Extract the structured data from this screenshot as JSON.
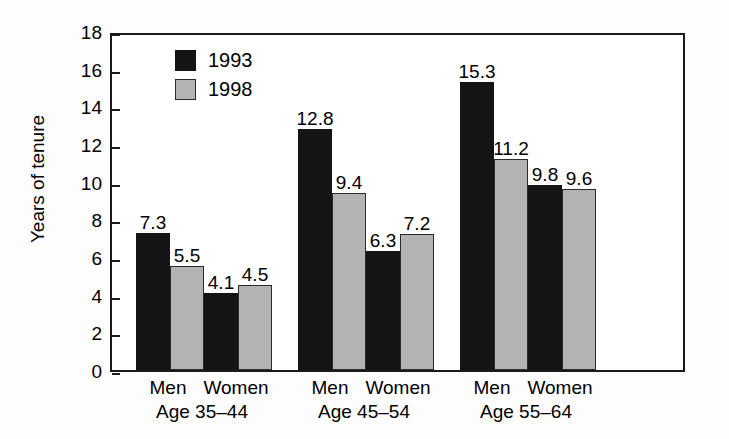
{
  "chart_data": {
    "type": "bar",
    "title": "",
    "xlabel": "",
    "ylabel": "Years of tenure",
    "ylim": [
      0,
      18
    ],
    "ytick_labels": [
      "18",
      "16",
      "14",
      "12",
      "10",
      "8",
      "6",
      "4",
      "2",
      "0"
    ],
    "yticks": [
      18,
      16,
      14,
      12,
      10,
      8,
      6,
      4,
      2,
      0
    ],
    "grid": false,
    "legend_position": "top-left-inside",
    "categories": [
      "Men",
      "Women",
      "Men",
      "Women",
      "Men",
      "Women"
    ],
    "groups": [
      {
        "label": "Age 35–44",
        "categories": [
          "Men",
          "Women"
        ]
      },
      {
        "label": "Age 45–54",
        "categories": [
          "Men",
          "Women"
        ]
      },
      {
        "label": "Age 55–64",
        "categories": [
          "Men",
          "Women"
        ]
      }
    ],
    "series": [
      {
        "name": "1993",
        "color": "#141414",
        "values": [
          7.3,
          4.1,
          12.8,
          6.3,
          15.3,
          9.8
        ]
      },
      {
        "name": "1998",
        "color": "#b3b3b3",
        "values": [
          5.5,
          4.5,
          9.4,
          7.2,
          11.2,
          9.6
        ]
      }
    ],
    "data_labels": [
      {
        "category": "Men",
        "group": "Age 35–44",
        "1993": "7.3",
        "1998": "5.5"
      },
      {
        "category": "Women",
        "group": "Age 35–44",
        "1993": "4.1",
        "1998": "4.5"
      },
      {
        "category": "Men",
        "group": "Age 45–54",
        "1993": "12.8",
        "1998": "9.4"
      },
      {
        "category": "Women",
        "group": "Age 45–54",
        "1993": "6.3",
        "1998": "7.2"
      },
      {
        "category": "Men",
        "group": "Age 55–64",
        "1993": "15.3",
        "1998": "11.2"
      },
      {
        "category": "Women",
        "group": "Age 55–64",
        "1993": "9.8",
        "1998": "9.6"
      }
    ]
  },
  "legend": {
    "items": [
      {
        "label": "1993",
        "swatch": "#141414"
      },
      {
        "label": "1998",
        "swatch": "#b3b3b3"
      }
    ]
  },
  "axis": {
    "y_title": "Years of tenure"
  }
}
